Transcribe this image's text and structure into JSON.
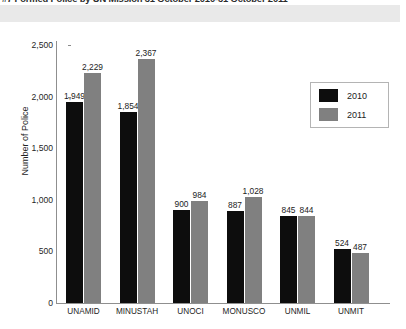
{
  "chart_data": {
    "type": "bar",
    "title": "#7 Formed Police by UN Mission 31 October 2010-31 October 2011",
    "xlabel": "",
    "ylabel": "Number of Police",
    "ylim": [
      0,
      2500
    ],
    "ytick_labels": [
      "0",
      "500",
      "1,000",
      "1,500",
      "2,000",
      "2,500"
    ],
    "ytick_values": [
      0,
      500,
      1000,
      1500,
      2000,
      2500
    ],
    "grid": false,
    "legend_position": "top-right",
    "categories": [
      "UNAMID",
      "MINUSTAH",
      "UNOCI",
      "MONUSCO",
      "UNMIL",
      "UNMIT"
    ],
    "series": [
      {
        "name": "2010",
        "color": "#0d0d0d",
        "values": [
          1949,
          1854,
          900,
          887,
          845,
          524
        ],
        "labels": [
          "1,949",
          "1,854",
          "900",
          "887",
          "845",
          "524"
        ]
      },
      {
        "name": "2011",
        "color": "#808080",
        "values": [
          2229,
          2367,
          984,
          1028,
          844,
          487
        ],
        "labels": [
          "2,229",
          "2,367",
          "984",
          "1,028",
          "844",
          "487"
        ]
      }
    ]
  },
  "legend": {
    "items": [
      {
        "label": "2010",
        "color": "#0d0d0d"
      },
      {
        "label": "2011",
        "color": "#808080"
      }
    ]
  }
}
